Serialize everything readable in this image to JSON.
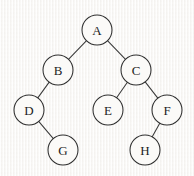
{
  "diagram": {
    "type": "binary-tree",
    "canvas": {
      "width": 194,
      "height": 176
    },
    "style": {
      "background_color": "#f7f6f4",
      "node_fill_color": "#fbfaf8",
      "node_stroke_color": "#2e2e2e",
      "edge_stroke_color": "#3a3a3a",
      "label_color": "#1d1d1d",
      "node_radius": 15
    },
    "nodes": [
      {
        "id": "A",
        "label": "A",
        "cx": 97,
        "cy": 30,
        "r": 15,
        "depth": 0
      },
      {
        "id": "B",
        "label": "B",
        "cx": 58,
        "cy": 70,
        "r": 15,
        "depth": 1
      },
      {
        "id": "C",
        "label": "C",
        "cx": 136,
        "cy": 70,
        "r": 15,
        "depth": 1
      },
      {
        "id": "D",
        "label": "D",
        "cx": 29,
        "cy": 110,
        "r": 15,
        "depth": 2
      },
      {
        "id": "E",
        "label": "E",
        "cx": 108,
        "cy": 110,
        "r": 15,
        "depth": 2
      },
      {
        "id": "F",
        "label": "F",
        "cx": 167,
        "cy": 110,
        "r": 15,
        "depth": 2
      },
      {
        "id": "G",
        "label": "G",
        "cx": 63,
        "cy": 150,
        "r": 15,
        "depth": 3
      },
      {
        "id": "H",
        "label": "H",
        "cx": 145,
        "cy": 150,
        "r": 15,
        "depth": 3
      }
    ],
    "edges": [
      {
        "from": "A",
        "to": "B",
        "side": "left"
      },
      {
        "from": "A",
        "to": "C",
        "side": "right"
      },
      {
        "from": "B",
        "to": "D",
        "side": "left"
      },
      {
        "from": "C",
        "to": "E",
        "side": "left"
      },
      {
        "from": "C",
        "to": "F",
        "side": "right"
      },
      {
        "from": "D",
        "to": "G",
        "side": "right"
      },
      {
        "from": "F",
        "to": "H",
        "side": "left"
      }
    ]
  }
}
